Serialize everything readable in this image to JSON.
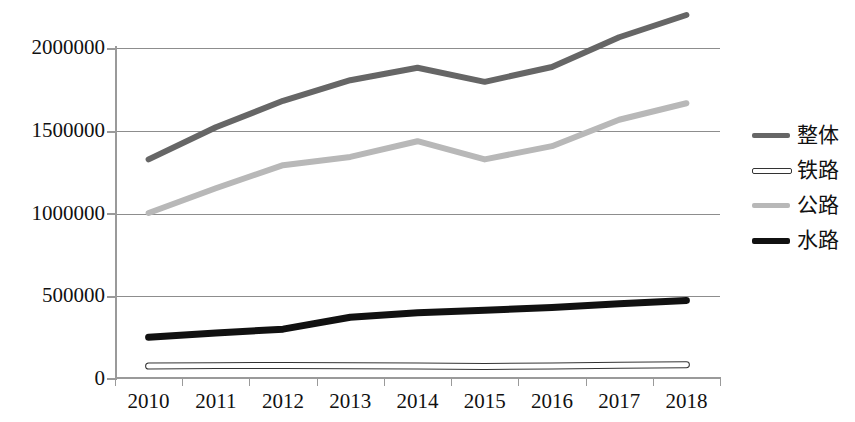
{
  "chart_data": {
    "type": "line",
    "title": "",
    "xlabel": "",
    "ylabel": "",
    "x": [
      "2010",
      "2011",
      "2012",
      "2013",
      "2014",
      "2015",
      "2016",
      "2017",
      "2018"
    ],
    "categories": [
      "2010",
      "2011",
      "2012",
      "2013",
      "2014",
      "2015",
      "2016",
      "2017",
      "2018"
    ],
    "ylim": [
      0,
      2000000
    ],
    "ytick_labels": [
      "2000000",
      "1500000",
      "1000000",
      "500000",
      "0"
    ],
    "ytick_values": [
      2000000,
      1500000,
      1000000,
      500000,
      0
    ],
    "ytick_step": 500000,
    "grid": true,
    "legend_position": "right",
    "series": [
      {
        "name": "整体",
        "color": "#666666",
        "width": 6,
        "values": [
          1325000,
          1520000,
          1680000,
          1805000,
          1880000,
          1795000,
          1885000,
          2065000,
          2200000
        ]
      },
      {
        "name": "铁路",
        "color": "#ffffff",
        "outline": "#333333",
        "width": 5,
        "values": [
          72000,
          75000,
          76000,
          75000,
          72000,
          70000,
          73000,
          78000,
          80000
        ]
      },
      {
        "name": "公路",
        "color": "#b8b8b8",
        "width": 6,
        "values": [
          1000000,
          1150000,
          1290000,
          1340000,
          1435000,
          1325000,
          1405000,
          1565000,
          1665000
        ]
      },
      {
        "name": "水路",
        "color": "#111111",
        "width": 7,
        "values": [
          247000,
          273000,
          296000,
          368000,
          396000,
          411000,
          428000,
          450000,
          470000
        ]
      }
    ]
  },
  "legend": {
    "items": [
      {
        "label": "整体"
      },
      {
        "label": "铁路"
      },
      {
        "label": "公路"
      },
      {
        "label": "水路"
      }
    ]
  }
}
